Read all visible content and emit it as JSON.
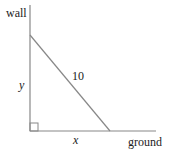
{
  "diagram": {
    "labels": {
      "wall": "wall",
      "ground": "ground",
      "height": "y",
      "base": "x",
      "hypotenuse": "10"
    },
    "line_color": "#888888",
    "text_color": "#222222"
  }
}
